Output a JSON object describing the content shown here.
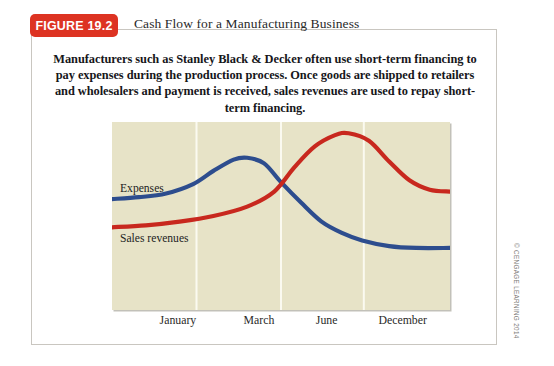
{
  "figure": {
    "badge_label": "FIGURE 19.2",
    "title": "Cash Flow for a Manufacturing Business",
    "caption": "Manufacturers such as Stanley Black & Decker often use short-term financing to pay expenses during the production process. Once goods are shipped to retailers and wholesalers and payment is received, sales revenues are used to repay short-term financing.",
    "copyright": "© CENGAGE LEARNING 2014"
  },
  "colors": {
    "badge_red": "#dd3322",
    "expenses_blue": "#2d4d8e",
    "sales_red": "#c8281e",
    "plot_background": "#e7e3c7",
    "gridline": "#fbfaf0",
    "card_border": "#c9c6c0"
  },
  "chart_data": {
    "type": "line",
    "title": "Cash Flow for a Manufacturing Business",
    "xlabel": "",
    "ylabel": "",
    "grid": "vertical",
    "legend_position": "in-plot-left",
    "categories": [
      "January",
      "March",
      "June",
      "December"
    ],
    "tick_positions_pct": [
      19.5,
      43.5,
      63.5,
      86.0
    ],
    "gridline_positions_pct": [
      25.0,
      50.0,
      74.5
    ],
    "xlim": [
      0,
      100
    ],
    "ylim": [
      0,
      100
    ],
    "series": [
      {
        "name": "Expenses",
        "color": "#2d4d8e",
        "x": [
          0,
          8,
          16,
          24,
          30,
          36,
          40,
          45,
          50,
          56,
          62,
          68,
          74,
          82,
          90,
          100
        ],
        "values": [
          59,
          60,
          62,
          67,
          74,
          80,
          81,
          78,
          68,
          57,
          47,
          41,
          37,
          34,
          33,
          33
        ]
      },
      {
        "name": "Sales revenues",
        "color": "#c8281e",
        "x": [
          0,
          10,
          20,
          30,
          40,
          48,
          54,
          60,
          66,
          70,
          76,
          82,
          88,
          94,
          100
        ],
        "values": [
          44,
          45,
          47,
          50,
          55,
          63,
          76,
          87,
          93,
          94,
          90,
          79,
          69,
          64,
          63
        ]
      }
    ]
  }
}
